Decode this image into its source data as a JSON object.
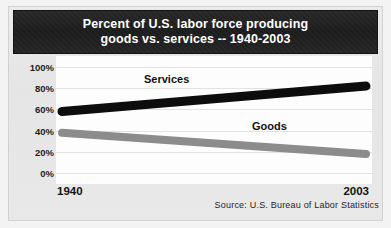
{
  "figure": {
    "title_line_1": "Percent of U.S. labor force producing",
    "title_line_2": "goods vs. services -- 1940-2003",
    "source_note": "Source:  U.S. Bureau of Labor Statistics",
    "banner_color": "#1f1f1f",
    "plot_background": "#fdfdfd",
    "paper_background": "#ececec"
  },
  "chart_data": {
    "type": "line",
    "title": "Percent of U.S. labor force producing goods vs. services -- 1940-2003",
    "xlabel": "",
    "ylabel": "",
    "x": [
      1940,
      2003
    ],
    "x_tick_labels": [
      "1940",
      "2003"
    ],
    "xlim": [
      1940,
      2003
    ],
    "ylim": [
      0,
      100
    ],
    "y_ticks": [
      100,
      80,
      60,
      40,
      20,
      0
    ],
    "y_tick_labels": [
      "100%",
      "80%",
      "60%",
      "40%",
      "20%",
      "0%"
    ],
    "grid": true,
    "grid_axis": "y",
    "legend": "inline-labels",
    "units": "percent",
    "series": [
      {
        "name": "Services",
        "color": "#0d0d0d",
        "line_width": 9,
        "values": [
          58,
          82
        ]
      },
      {
        "name": "Goods",
        "color": "#8c8c8c",
        "line_width": 8,
        "values": [
          38,
          18
        ]
      }
    ],
    "annotations": [
      {
        "text": "Services",
        "x": 1962,
        "y": 76
      },
      {
        "text": "Goods",
        "x": 1985,
        "y": 28
      }
    ]
  },
  "axis": {
    "y_labels": [
      "100%",
      "80%",
      "60%",
      "40%",
      "20%",
      "0%"
    ],
    "x_start_label": "1940",
    "x_end_label": "2003"
  }
}
